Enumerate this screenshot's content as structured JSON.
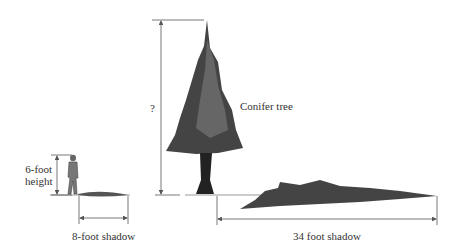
{
  "labels": {
    "person_height_line1": "6-foot",
    "person_height_line2": "height",
    "person_shadow": "8-foot shadow",
    "tree_height": "?",
    "tree_name": "Conifer tree",
    "tree_shadow": "34 foot shadow"
  },
  "colors": {
    "line": "#555555",
    "tree": "#333333",
    "tree_mid": "#555555",
    "shadow": "#444444"
  }
}
